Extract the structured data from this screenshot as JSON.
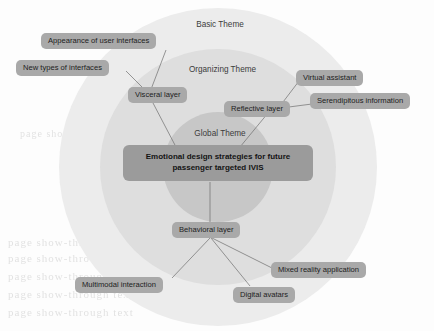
{
  "figure": {
    "type": "concentric-thematic-map",
    "width": 434,
    "height": 331
  },
  "rings": {
    "outer": {
      "label": "Basic Theme",
      "color": "#ececec"
    },
    "middle": {
      "label": "Organizing Theme",
      "color": "#dedede"
    },
    "inner": {
      "label": "Global Theme",
      "color": "#c7c7c7"
    }
  },
  "center": {
    "line1": "Emotional design strategies for future",
    "line2": "passenger targeted IVIS",
    "color": "#9b9b9b"
  },
  "layers": {
    "visceral": "Visceral layer",
    "reflective": "Reflective layer",
    "behavioral": "Behavioral layer"
  },
  "basic_themes": {
    "appearance": "Appearance of user interfaces",
    "new_types": "New types of interfaces",
    "virtual_assistant": "Virtual assistant",
    "serendipitous": "Serendipitous information",
    "multimodal": "Multimodal interaction",
    "digital_avatars": "Digital avatars",
    "mixed_reality": "Mixed reality application"
  },
  "palette": {
    "pill": "#a9a9a9",
    "center_box": "#9b9b9b",
    "connector": "#6e6e6e",
    "text": "#1d1d1d"
  },
  "background_bleed": {
    "l1": "page show-through text",
    "l2": "page show-through text",
    "l3": "page show-through text",
    "l4": "page show-through text",
    "l5": "page show-through text",
    "l6": "page show-through text",
    "l7": "page show-through text"
  }
}
